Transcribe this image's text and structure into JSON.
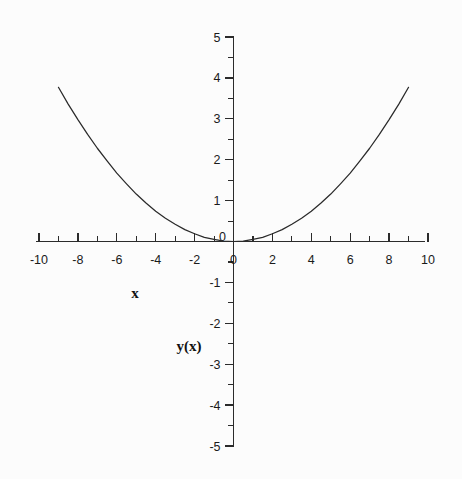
{
  "chart_data": {
    "type": "line",
    "title": "",
    "subtitle": "",
    "xlabel": "x",
    "ylabel": "y(x)",
    "xlim": [
      -10,
      10
    ],
    "ylim": [
      -5,
      5
    ],
    "grid": false,
    "legend": null,
    "x_major_tick_step": 2,
    "x_minor_tick_step": 1,
    "y_major_tick_step": 1,
    "y_minor_tick_step": 0.5,
    "x_tick_labels": [
      "-10",
      "-8",
      "-6",
      "-4",
      "-2",
      "0",
      "2",
      "4",
      "6",
      "8",
      "10"
    ],
    "x_tick_values": [
      -10,
      -8,
      -6,
      -4,
      -2,
      0,
      2,
      4,
      6,
      8,
      10
    ],
    "y_tick_labels": [
      "5",
      "4",
      "3",
      "2",
      "1",
      "0",
      "-1",
      "-2",
      "-3",
      "-4",
      "-5"
    ],
    "y_tick_values": [
      5,
      4,
      3,
      2,
      1,
      0,
      -1,
      -2,
      -3,
      -4,
      -5
    ],
    "origin_label": "0",
    "series": [
      {
        "name": "y(x)",
        "color": "#2a2a2a",
        "domain": [
          -9,
          9
        ],
        "x": [
          -9,
          -8.5,
          -8,
          -7.5,
          -7,
          -6.5,
          -6,
          -5.5,
          -5,
          -4.5,
          -4,
          -3.5,
          -3,
          -2.5,
          -2,
          -1.5,
          -1,
          -0.5,
          0,
          0.5,
          1,
          1.5,
          2,
          2.5,
          3,
          3.5,
          4,
          4.5,
          5,
          5.5,
          6,
          6.5,
          7,
          7.5,
          8,
          8.5,
          9
        ],
        "values": [
          3.77,
          3.36,
          2.98,
          2.62,
          2.28,
          1.97,
          1.67,
          1.41,
          1.16,
          0.94,
          0.74,
          0.57,
          0.42,
          0.29,
          0.19,
          0.1,
          0.05,
          0.01,
          0,
          0.01,
          0.05,
          0.1,
          0.19,
          0.29,
          0.42,
          0.57,
          0.74,
          0.94,
          1.16,
          1.41,
          1.67,
          1.97,
          2.28,
          2.62,
          2.98,
          3.36,
          3.77
        ]
      }
    ]
  },
  "labels": {
    "x_axis_name": "x",
    "y_axis_name": "y(x)"
  },
  "colors": {
    "background": "#fcfcfc",
    "axis": "#2b2b2b",
    "curve": "#2a2a2a",
    "text": "#1a1a1a"
  }
}
